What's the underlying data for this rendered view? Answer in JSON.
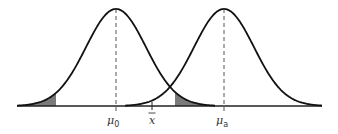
{
  "diagram": {
    "title": "",
    "colors": {
      "curve": "#111111",
      "axis": "#222222",
      "shade": "#7a7a7a",
      "dashed": "#555555",
      "background": "#ffffff"
    },
    "axis": {
      "y": 106,
      "x_start": 17,
      "x_end": 322
    },
    "distributions": [
      {
        "name": "null-distribution",
        "mean_label": "μ",
        "mean_sub": "0",
        "center_x": 116,
        "sigma_px": 30,
        "peak_y": 9
      },
      {
        "name": "alternative-distribution",
        "mean_label": "μ",
        "mean_sub": "a",
        "center_x": 224,
        "sigma_px": 30,
        "peak_y": 9
      }
    ],
    "shaded_regions": [
      {
        "name": "left-tail-region",
        "under": "null-distribution",
        "x_from": 17,
        "x_to": 56
      },
      {
        "name": "right-tail-region",
        "under": "null-distribution",
        "x_from": 175,
        "x_to": 213
      }
    ],
    "labels": {
      "mu0": "μ",
      "mu0_sub": "0",
      "xbar": "x",
      "mua": "μ",
      "mua_sub": "a"
    },
    "xbar_tick_x": 152
  }
}
